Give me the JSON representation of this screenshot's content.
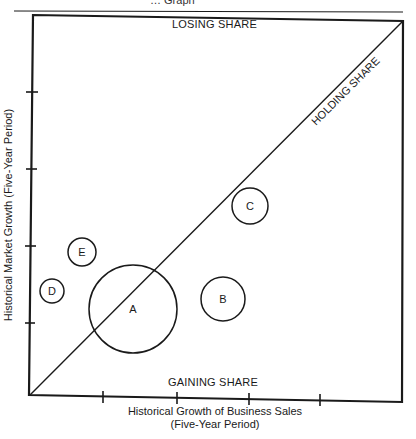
{
  "header": {
    "text": "… Graph"
  },
  "chart_data": {
    "type": "bubble-quadrant",
    "title": "",
    "xlabel": "Historical Growth of Business Sales (Five-Year Period)",
    "xlabel_line1": "Historical Growth of Business Sales",
    "xlabel_line2": "(Five-Year Period)",
    "ylabel": "Historical Market Growth (Five-Year Period)",
    "x_ticks": 4,
    "y_ticks": 4,
    "regions": {
      "top": "LOSING SHARE",
      "bottom": "GAINING SHARE",
      "diagonal": "HOLDING SHARE"
    },
    "bubbles": [
      {
        "label": "A",
        "cx": 133,
        "cy": 309,
        "r": 44
      },
      {
        "label": "B",
        "cx": 223,
        "cy": 299,
        "r": 22
      },
      {
        "label": "C",
        "cx": 250,
        "cy": 206,
        "r": 18
      },
      {
        "label": "D",
        "cx": 52,
        "cy": 291,
        "r": 12
      },
      {
        "label": "E",
        "cx": 82,
        "cy": 252,
        "r": 14
      }
    ]
  },
  "colors": {
    "ink": "#1a1a1a",
    "background": "#ffffff"
  }
}
